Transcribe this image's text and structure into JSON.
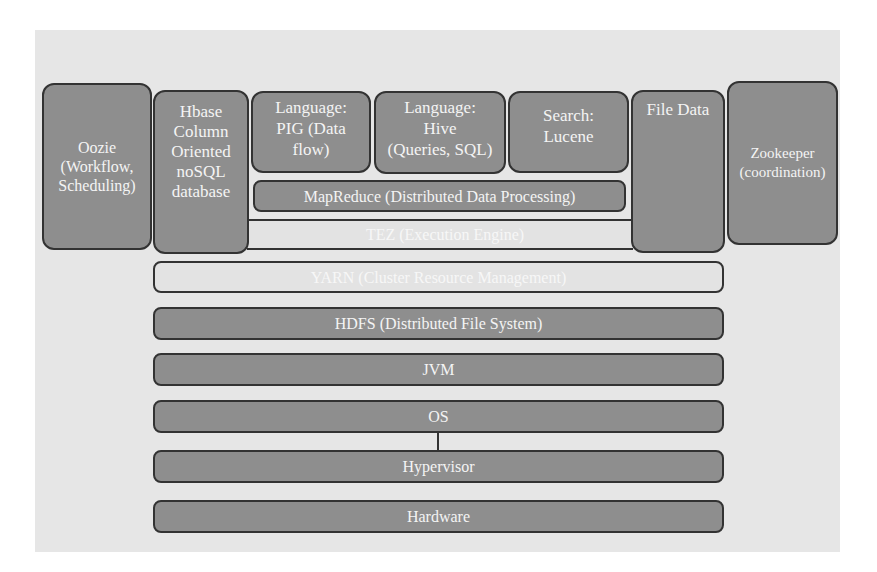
{
  "diagram": {
    "colors": {
      "background": "#e6e6e6",
      "box_fill": "#8e8e8e",
      "light_fill": "#e3e3e3",
      "border": "#333333",
      "text": "#f4f4f4"
    },
    "side_components": {
      "oozie": "Oozie\n(Workflow,\nScheduling)",
      "hbase": "Hbase\nColumn\nOriented\nnoSQL\ndatabase",
      "file_data": "File Data",
      "zookeeper": "Zookeeper\n(coordination)"
    },
    "tools": {
      "pig": "Language:\nPIG (Data\nflow)",
      "hive": "Language:\nHive\n(Queries, SQL)",
      "lucene": "Search:\nLucene"
    },
    "layers": {
      "mapreduce": "MapReduce (Distributed Data Processing)",
      "tez": "TEZ (Execution Engine)",
      "yarn": "YARN (Cluster Resource Management)",
      "hdfs": "HDFS (Distributed File System)",
      "jvm": "JVM",
      "os": "OS",
      "hypervisor": "Hypervisor",
      "hardware": "Hardware"
    }
  }
}
